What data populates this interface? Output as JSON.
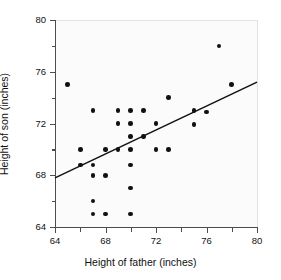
{
  "chart_data": {
    "type": "scatter",
    "title": "",
    "xlabel": "Height of father (inches)",
    "ylabel": "Height of son (inches)",
    "xlim": [
      64,
      80
    ],
    "ylim": [
      64,
      80
    ],
    "xticks": [
      64,
      68,
      72,
      76,
      80
    ],
    "yticks": [
      64,
      68,
      72,
      76,
      80
    ],
    "xticklabels": [
      "64",
      "68",
      "72",
      "76",
      "80"
    ],
    "yticklabels": [
      "64",
      "68",
      "72",
      "76",
      "80"
    ],
    "x_minor_ticks": [
      66,
      70,
      74,
      78
    ],
    "y_minor_ticks": [
      66,
      70,
      74,
      78
    ],
    "grid": false,
    "legend": null,
    "marker": "filled-circle",
    "marker_color": "#111111",
    "points": [
      {
        "x": 65.0,
        "y": 75.0
      },
      {
        "x": 66.0,
        "y": 70.0
      },
      {
        "x": 66.0,
        "y": 68.8
      },
      {
        "x": 67.0,
        "y": 73.0
      },
      {
        "x": 67.0,
        "y": 68.8
      },
      {
        "x": 67.0,
        "y": 68.0
      },
      {
        "x": 67.0,
        "y": 66.0
      },
      {
        "x": 67.0,
        "y": 65.0
      },
      {
        "x": 68.0,
        "y": 70.0
      },
      {
        "x": 68.0,
        "y": 68.0
      },
      {
        "x": 68.0,
        "y": 65.0
      },
      {
        "x": 69.0,
        "y": 73.0
      },
      {
        "x": 69.0,
        "y": 72.0
      },
      {
        "x": 69.0,
        "y": 70.0
      },
      {
        "x": 70.0,
        "y": 73.0
      },
      {
        "x": 70.0,
        "y": 72.0
      },
      {
        "x": 70.0,
        "y": 71.0
      },
      {
        "x": 70.0,
        "y": 70.0
      },
      {
        "x": 70.0,
        "y": 68.8
      },
      {
        "x": 70.0,
        "y": 67.0
      },
      {
        "x": 70.0,
        "y": 65.0
      },
      {
        "x": 71.0,
        "y": 73.0
      },
      {
        "x": 71.0,
        "y": 71.0
      },
      {
        "x": 72.0,
        "y": 72.0
      },
      {
        "x": 72.0,
        "y": 70.0
      },
      {
        "x": 73.0,
        "y": 74.0
      },
      {
        "x": 73.0,
        "y": 70.0
      },
      {
        "x": 75.0,
        "y": 73.0
      },
      {
        "x": 75.0,
        "y": 71.9
      },
      {
        "x": 76.0,
        "y": 72.9
      },
      {
        "x": 77.0,
        "y": 78.0
      },
      {
        "x": 78.0,
        "y": 75.0
      }
    ],
    "trendline": {
      "type": "line",
      "color": "#111111",
      "x0": 64.0,
      "y0": 67.8,
      "x1": 80.0,
      "y1": 75.2
    }
  }
}
